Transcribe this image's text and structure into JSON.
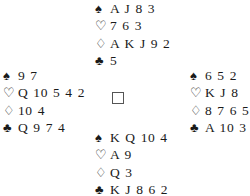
{
  "suit_symbols": {
    "spades": "♠",
    "hearts": "♡",
    "diamonds": "♢",
    "clubs": "♣"
  },
  "hands": {
    "north": {
      "spades": "A J 8 3",
      "hearts": "7 6 3",
      "diamonds": "A K J 9 2",
      "clubs": "5"
    },
    "west": {
      "spades": "9 7",
      "hearts": "Q 10 5 4 2",
      "diamonds": "10 4",
      "clubs": "Q 9 7 4"
    },
    "east": {
      "spades": "6 5 2",
      "hearts": "K J 8",
      "diamonds": "8 7 6 5",
      "clubs": "A 10 3"
    },
    "south": {
      "spades": "K Q 10 4",
      "hearts": "A 9",
      "diamonds": "Q 3",
      "clubs": "K J 8 6 2"
    }
  }
}
